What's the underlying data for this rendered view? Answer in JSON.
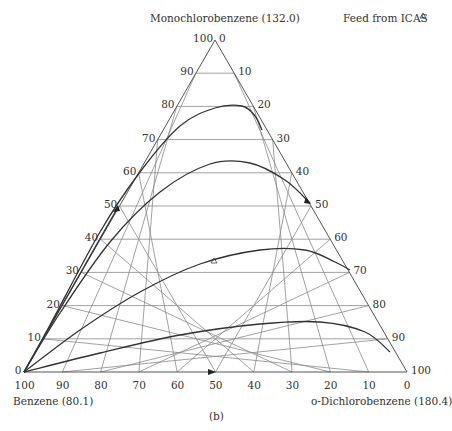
{
  "diagram": {
    "type": "ternary",
    "caption": "(b)",
    "vertices": {
      "top": {
        "name": "Monochlorobenzene (132.0)"
      },
      "left": {
        "name": "Benzene (80.1)"
      },
      "right": {
        "name": "o-Dichlorobenzene (180.4)"
      }
    },
    "legend": {
      "feed_label": "Feed from ICAS",
      "feed_marker": "triangle"
    },
    "axes": {
      "left_edge_ticks": [
        "0",
        "10",
        "20",
        "30",
        "40",
        "50",
        "60",
        "70",
        "80",
        "90",
        "100"
      ],
      "right_edge_ticks": [
        "0",
        "10",
        "20",
        "30",
        "40",
        "50",
        "60",
        "70",
        "80",
        "90",
        "100"
      ],
      "bottom_edge_ticks": [
        "100",
        "90",
        "80",
        "70",
        "60",
        "50",
        "40",
        "30",
        "20",
        "10",
        "0"
      ]
    },
    "colors": {
      "grid": "#8a8a8a",
      "curve": "#333333",
      "text": "#333333"
    }
  },
  "chart_data": {
    "type": "ternary",
    "title": "",
    "components": [
      "Monochlorobenzene (132.0)",
      "Benzene (80.1)",
      "o-Dichlorobenzene (180.4)"
    ],
    "grid_step": 10,
    "legend": [
      "Feed from ICAS"
    ],
    "feed_point": {
      "monochlorobenzene": 30,
      "o_dichlorobenzene": 48,
      "benzene": 22
    },
    "residue_curves_px": [
      [
        [
          24,
          372
        ],
        [
          50,
          325
        ],
        [
          100,
          232
        ],
        [
          140,
          172
        ],
        [
          180,
          126
        ],
        [
          215,
          108
        ],
        [
          242,
          106
        ],
        [
          255,
          116
        ],
        [
          262,
          130
        ]
      ],
      [
        [
          24,
          372
        ],
        [
          60,
          313
        ],
        [
          110,
          242
        ],
        [
          160,
          192
        ],
        [
          210,
          164
        ],
        [
          250,
          163
        ],
        [
          285,
          180
        ],
        [
          310,
          203
        ]
      ],
      [
        [
          24,
          372
        ],
        [
          80,
          330
        ],
        [
          140,
          292
        ],
        [
          200,
          264
        ],
        [
          260,
          250
        ],
        [
          305,
          250
        ],
        [
          335,
          262
        ],
        [
          350,
          270
        ]
      ],
      [
        [
          24,
          372
        ],
        [
          100,
          353
        ],
        [
          180,
          335
        ],
        [
          260,
          324
        ],
        [
          320,
          322
        ],
        [
          365,
          332
        ],
        [
          390,
          352
        ]
      ]
    ],
    "straight_line_px": [
      [
        24,
        372
      ],
      [
        118,
        207
      ]
    ],
    "caption": "(b)"
  }
}
